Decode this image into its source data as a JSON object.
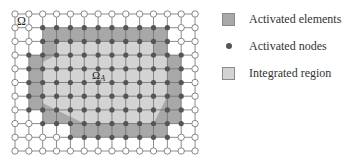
{
  "diagram": {
    "domain_label": "Ω",
    "subdomain_label": "Ω",
    "subdomain_subscript": "A",
    "grid": {
      "columns": 14,
      "rows": 11,
      "x0": 15,
      "dx": 13.85,
      "y0": 14,
      "dy": 13.7
    },
    "activated_region": [
      [
        2,
        1
      ],
      [
        11,
        1
      ],
      [
        11,
        3
      ],
      [
        12,
        3
      ],
      [
        12,
        8
      ],
      [
        11,
        8
      ],
      [
        11,
        9
      ],
      [
        4,
        9
      ],
      [
        4,
        8
      ],
      [
        2,
        8
      ],
      [
        2,
        7
      ],
      [
        1,
        7
      ],
      [
        1,
        3
      ],
      [
        2,
        3
      ]
    ],
    "integrated_region": [
      [
        3,
        2
      ],
      [
        10,
        2
      ],
      [
        10,
        3
      ],
      [
        11,
        3
      ],
      [
        11,
        6
      ],
      [
        10.5,
        7
      ],
      [
        10,
        8
      ],
      [
        5,
        8
      ],
      [
        4,
        7.5
      ],
      [
        3,
        7
      ],
      [
        2,
        6.5
      ],
      [
        2,
        3.5
      ],
      [
        3,
        3
      ]
    ],
    "colors": {
      "activated_elements": "#a8a8a8",
      "integrated_region": "#d3d3d3",
      "grid_line": "#6e6e6e",
      "active_node": "#555555",
      "inactive_node_stroke": "#7a7a7a"
    }
  },
  "legend": {
    "items": [
      {
        "label": "Activated elements",
        "symbol": "dark-square"
      },
      {
        "label": "Activated nodes",
        "symbol": "dot"
      },
      {
        "label": "Integrated region",
        "symbol": "light-square"
      }
    ]
  }
}
